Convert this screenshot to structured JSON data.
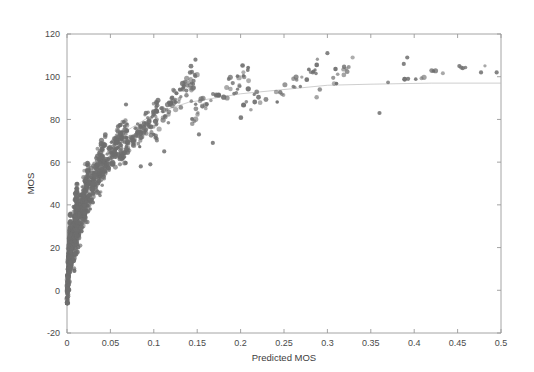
{
  "figure": {
    "background_color": "#ffffff",
    "axis_color": "#9a9a9a",
    "marker_color": "#6e6e6e",
    "fit_curve_color": "#b9b9b9"
  },
  "chart_data": {
    "type": "scatter",
    "title": "",
    "xlabel": "Predicted MOS",
    "ylabel": "MOS",
    "xlim": [
      0,
      0.5
    ],
    "ylim": [
      -20,
      120
    ],
    "xticks": [
      0,
      0.05,
      0.1,
      0.15,
      0.2,
      0.25,
      0.3,
      0.35,
      0.4,
      0.45,
      0.5
    ],
    "xtick_labels": [
      "0",
      "0.05",
      "0.1",
      "0.15",
      "0.2",
      "0.25",
      "0.3",
      "0.35",
      "0.4",
      "0.45",
      "0.5"
    ],
    "yticks": [
      -20,
      0,
      20,
      40,
      60,
      80,
      100,
      120
    ],
    "ytick_labels": [
      "-20",
      "0",
      "20",
      "40",
      "60",
      "80",
      "100",
      "120"
    ],
    "grid": false,
    "legend": null,
    "marker": "dot",
    "marker_size": 2.1,
    "series": [
      {
        "name": "observations",
        "type": "scatter",
        "color": "#6e6e6e",
        "point_count_approx": 1200,
        "description": "Dense saturating cloud rising steeply from (0,0) and flattening near MOS 100 for Predicted MOS above 0.2",
        "clusters": [
          {
            "x_range": [
              0.0,
              0.004
            ],
            "y_range": [
              -4,
              30
            ],
            "n": 210,
            "note": "near-vertical band at origin"
          },
          {
            "x_range": [
              0.002,
              0.012
            ],
            "y_range": [
              8,
              42
            ],
            "n": 230
          },
          {
            "x_range": [
              0.008,
              0.025
            ],
            "y_range": [
              20,
              55
            ],
            "n": 220
          },
          {
            "x_range": [
              0.018,
              0.045
            ],
            "y_range": [
              35,
              68
            ],
            "n": 190
          },
          {
            "x_range": [
              0.035,
              0.07
            ],
            "y_range": [
              50,
              78
            ],
            "n": 140
          },
          {
            "x_range": [
              0.06,
              0.105
            ],
            "y_range": [
              62,
              85
            ],
            "n": 110
          },
          {
            "x_range": [
              0.095,
              0.15
            ],
            "y_range": [
              75,
              100
            ],
            "n": 80
          },
          {
            "x_range": [
              0.14,
              0.21
            ],
            "y_range": [
              80,
              102
            ],
            "n": 45
          },
          {
            "x_range": [
              0.2,
              0.29
            ],
            "y_range": [
              85,
              104
            ],
            "n": 32
          },
          {
            "x_range": [
              0.285,
              0.33
            ],
            "y_range": [
              92,
              106
            ],
            "n": 14
          },
          {
            "x_range": [
              0.35,
              0.5
            ],
            "y_range": [
              95,
              108
            ],
            "n": 12,
            "note": "sparse tail"
          }
        ],
        "outliers": [
          {
            "x": 0.068,
            "y": 87
          },
          {
            "x": 0.085,
            "y": 58
          },
          {
            "x": 0.096,
            "y": 59
          },
          {
            "x": 0.112,
            "y": 65
          },
          {
            "x": 0.148,
            "y": 108
          },
          {
            "x": 0.152,
            "y": 73
          },
          {
            "x": 0.168,
            "y": 69
          },
          {
            "x": 0.3,
            "y": 111
          },
          {
            "x": 0.36,
            "y": 83
          },
          {
            "x": 0.392,
            "y": 109
          },
          {
            "x": 0.388,
            "y": 106
          },
          {
            "x": 0.393,
            "y": 99
          },
          {
            "x": 0.452,
            "y": 105
          },
          {
            "x": 0.456,
            "y": 104
          },
          {
            "x": 0.477,
            "y": 102
          },
          {
            "x": 0.495,
            "y": 102
          }
        ]
      },
      {
        "name": "fitted-logistic-curve",
        "type": "line",
        "color": "#b9b9b9",
        "description": "Monotone saturating fit asymptoting to ~97 MOS",
        "points": [
          {
            "x": 0.0,
            "y": 2
          },
          {
            "x": 0.01,
            "y": 28
          },
          {
            "x": 0.02,
            "y": 44
          },
          {
            "x": 0.035,
            "y": 58
          },
          {
            "x": 0.05,
            "y": 67
          },
          {
            "x": 0.07,
            "y": 75
          },
          {
            "x": 0.09,
            "y": 80
          },
          {
            "x": 0.11,
            "y": 84
          },
          {
            "x": 0.14,
            "y": 88
          },
          {
            "x": 0.17,
            "y": 90
          },
          {
            "x": 0.2,
            "y": 92
          },
          {
            "x": 0.25,
            "y": 94
          },
          {
            "x": 0.3,
            "y": 96
          },
          {
            "x": 0.35,
            "y": 96.5
          },
          {
            "x": 0.42,
            "y": 97
          },
          {
            "x": 0.5,
            "y": 97
          }
        ]
      }
    ]
  }
}
